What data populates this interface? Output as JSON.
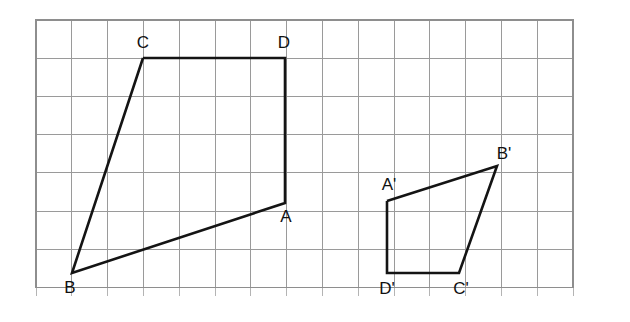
{
  "figure": {
    "background_color": "#ffffff",
    "grid": {
      "line_color": "#9a9a9a",
      "border_color": "#8e8e8e",
      "origin_x": 36,
      "origin_y": 20,
      "cell_width": 35.8,
      "cell_height": 38.2,
      "columns": 15,
      "rows": 7,
      "tick_overhang": 9
    },
    "stroke_color": "#141414",
    "stroke_width": 2.6,
    "shapes": [
      {
        "name": "quadrilateral-abcd",
        "closed": true,
        "points": [
          {
            "label": "A",
            "x": 285,
            "y": 203
          },
          {
            "label": "B",
            "x": 72,
            "y": 273
          },
          {
            "label": "C",
            "x": 143,
            "y": 58
          },
          {
            "label": "D",
            "x": 285,
            "y": 58
          }
        ],
        "path_order": [
          "C",
          "D",
          "A",
          "B",
          "C"
        ]
      },
      {
        "name": "quadrilateral-a-prime-b-prime-c-prime-d-prime",
        "closed": true,
        "points": [
          {
            "label": "A'",
            "x": 387,
            "y": 201
          },
          {
            "label": "B'",
            "x": 497,
            "y": 166
          },
          {
            "label": "C'",
            "x": 459,
            "y": 273
          },
          {
            "label": "D'",
            "x": 387,
            "y": 273
          }
        ],
        "path_order": [
          "A'",
          "B'",
          "C'",
          "D'",
          "A'"
        ]
      }
    ],
    "labels": [
      {
        "name": "label-c",
        "text": "C",
        "x": 143,
        "y": 48,
        "anchor": "middle"
      },
      {
        "name": "label-d",
        "text": "D",
        "x": 284,
        "y": 48,
        "anchor": "middle"
      },
      {
        "name": "label-a",
        "text": "A",
        "x": 286,
        "y": 222,
        "anchor": "middle"
      },
      {
        "name": "label-b",
        "text": "B",
        "x": 70,
        "y": 293,
        "anchor": "middle"
      },
      {
        "name": "label-a-prime",
        "text": "A'",
        "x": 389,
        "y": 190,
        "anchor": "middle"
      },
      {
        "name": "label-b-prime",
        "text": "B'",
        "x": 504,
        "y": 159,
        "anchor": "middle"
      },
      {
        "name": "label-c-prime",
        "text": "C'",
        "x": 461,
        "y": 294,
        "anchor": "middle"
      },
      {
        "name": "label-d-prime",
        "text": "D'",
        "x": 387,
        "y": 294,
        "anchor": "middle"
      }
    ]
  }
}
